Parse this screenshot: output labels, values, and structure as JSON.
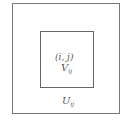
{
  "diagram": {
    "outer_box": {
      "label": "U",
      "subscript": "ij"
    },
    "inner_box": {
      "label": "V",
      "subscript": "ij",
      "point": "(i,  j)"
    }
  }
}
